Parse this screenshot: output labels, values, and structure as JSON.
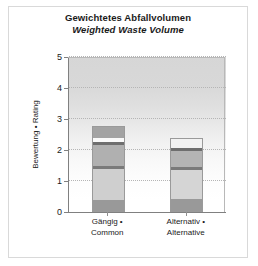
{
  "chart_data": {
    "type": "bar",
    "subtype": "stacked",
    "title": "Gewichtetes Abfallvolumen",
    "subtitle": "Weighted Waste Volume",
    "xlabel": "",
    "ylabel": "Bewertung • Rating",
    "ylim": [
      0,
      5
    ],
    "yticks": [
      "0",
      "1",
      "2",
      "3",
      "4",
      "5"
    ],
    "grid": "horizontal-dotted",
    "legend": "none",
    "categories": [
      "Gängig •\nCommon",
      "Alternativ •\nAlternative"
    ],
    "category_lines": [
      [
        "Gängig •",
        "Common"
      ],
      [
        "Alternativ •",
        "Alternative"
      ]
    ],
    "totals": [
      2.76,
      2.38
    ],
    "bars": [
      {
        "category": "Gängig • Common",
        "total": 2.76,
        "segments": [
          {
            "from": 0.0,
            "to": 0.38,
            "value": 0.38,
            "color": "#999999"
          },
          {
            "from": 0.38,
            "to": 1.39,
            "value": 1.01,
            "color": "#cfcfcf"
          },
          {
            "from": 1.39,
            "to": 1.48,
            "value": 0.09,
            "color": "#7a7a7a"
          },
          {
            "from": 1.48,
            "to": 2.16,
            "value": 0.68,
            "color": "#b0b0b0"
          },
          {
            "from": 2.16,
            "to": 2.26,
            "value": 0.1,
            "color": "#6e6e6e"
          },
          {
            "from": 2.26,
            "to": 2.39,
            "value": 0.13,
            "color": "#fafafa"
          },
          {
            "from": 2.39,
            "to": 2.76,
            "value": 0.37,
            "color": "#a3a3a3"
          }
        ]
      },
      {
        "category": "Alternativ • Alternative",
        "total": 2.38,
        "segments": [
          {
            "from": 0.0,
            "to": 0.42,
            "value": 0.42,
            "color": "#999999"
          },
          {
            "from": 0.42,
            "to": 1.35,
            "value": 0.93,
            "color": "#d5d5d5"
          },
          {
            "from": 1.35,
            "to": 1.45,
            "value": 0.1,
            "color": "#7a7a7a"
          },
          {
            "from": 1.45,
            "to": 1.97,
            "value": 0.52,
            "color": "#b4b4b4"
          },
          {
            "from": 1.97,
            "to": 2.06,
            "value": 0.09,
            "color": "#6e6e6e"
          },
          {
            "from": 2.06,
            "to": 2.38,
            "value": 0.32,
            "color": "#f2f2f2"
          }
        ]
      }
    ],
    "colors": {
      "axis": "#808080",
      "grid": "#b5b5b5",
      "text": "#1a1a1a",
      "panel_top": "#d6d6d6",
      "panel_bottom": "#ffffff",
      "frame": "#d9d9d9"
    }
  }
}
